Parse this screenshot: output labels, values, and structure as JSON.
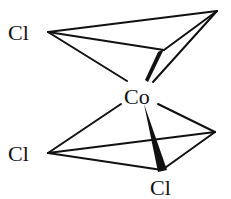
{
  "diagram": {
    "type": "molecular-structure",
    "central_atom": "Co",
    "atoms": [
      {
        "id": "cl_top",
        "label": "Cl"
      },
      {
        "id": "co",
        "label": "Co"
      },
      {
        "id": "cl_mid",
        "label": "Cl"
      },
      {
        "id": "cl_bottom",
        "label": "Cl"
      }
    ],
    "colors": {
      "ink": "#111111",
      "background": "#ffffff"
    }
  }
}
